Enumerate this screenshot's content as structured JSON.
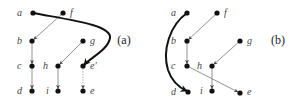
{
  "diagram": {
    "panels": [
      {
        "id": "a",
        "caption": "(a)",
        "caption_pos": [
          124,
          44
        ],
        "nodes": [
          {
            "id": "a",
            "label": "a",
            "x": 33,
            "y": 13,
            "lx": 17,
            "ly": 16
          },
          {
            "id": "f",
            "label": "f",
            "x": 63,
            "y": 13,
            "lx": 70,
            "ly": 16
          },
          {
            "id": "b",
            "label": "b",
            "x": 32,
            "y": 41,
            "lx": 17,
            "ly": 44
          },
          {
            "id": "g",
            "label": "g",
            "x": 83,
            "y": 41,
            "lx": 90,
            "ly": 44
          },
          {
            "id": "c",
            "label": "c",
            "x": 32,
            "y": 66,
            "lx": 17,
            "ly": 69
          },
          {
            "id": "h",
            "label": "h",
            "x": 58,
            "y": 66,
            "lx": 43,
            "ly": 69
          },
          {
            "id": "e'",
            "label": "e'",
            "x": 83,
            "y": 66,
            "lx": 90,
            "ly": 69
          },
          {
            "id": "d",
            "label": "d",
            "x": 32,
            "y": 91,
            "lx": 17,
            "ly": 94
          },
          {
            "id": "i",
            "label": "i",
            "x": 58,
            "y": 91,
            "lx": 46,
            "ly": 94
          },
          {
            "id": "e",
            "label": "e",
            "x": 83,
            "y": 91,
            "lx": 90,
            "ly": 94
          }
        ],
        "edges": [
          {
            "from": "f",
            "to": "b",
            "style": "thin"
          },
          {
            "from": "b",
            "to": "c",
            "style": "thin"
          },
          {
            "from": "c",
            "to": "d",
            "style": "thin"
          },
          {
            "from": "g",
            "to": "h",
            "style": "thin"
          },
          {
            "from": "h",
            "to": "i",
            "style": "thin"
          },
          {
            "from": "e'",
            "to": "e",
            "style": "dotted"
          },
          {
            "from": "a",
            "to": "e'",
            "style": "thick-curve",
            "path": "M33,13 C70,20 112,25 110,38 C108,50 90,58 84,65"
          }
        ]
      },
      {
        "id": "b",
        "caption": "(b)",
        "caption_pos": [
          278,
          44
        ],
        "nodes": [
          {
            "id": "a",
            "label": "a",
            "x": 187,
            "y": 13,
            "lx": 171,
            "ly": 16
          },
          {
            "id": "f",
            "label": "f",
            "x": 217,
            "y": 13,
            "lx": 224,
            "ly": 16
          },
          {
            "id": "b",
            "label": "b",
            "x": 187,
            "y": 41,
            "lx": 171,
            "ly": 44
          },
          {
            "id": "g",
            "label": "g",
            "x": 240,
            "y": 41,
            "lx": 247,
            "ly": 44
          },
          {
            "id": "c",
            "label": "c",
            "x": 187,
            "y": 66,
            "lx": 171,
            "ly": 69
          },
          {
            "id": "h",
            "label": "h",
            "x": 212,
            "y": 66,
            "lx": 197,
            "ly": 69
          },
          {
            "id": "d",
            "label": "d",
            "x": 188,
            "y": 92,
            "lx": 171,
            "ly": 95
          },
          {
            "id": "i",
            "label": "i",
            "x": 212,
            "y": 91,
            "lx": 200,
            "ly": 94
          },
          {
            "id": "e",
            "label": "e",
            "x": 240,
            "y": 93,
            "lx": 247,
            "ly": 95
          }
        ],
        "edges": [
          {
            "from": "f",
            "to": "b",
            "style": "thin"
          },
          {
            "from": "b",
            "to": "c",
            "style": "thin"
          },
          {
            "from": "g",
            "to": "h",
            "style": "thin"
          },
          {
            "from": "h",
            "to": "i",
            "style": "thin"
          },
          {
            "from": "c",
            "to": "e",
            "style": "thin"
          },
          {
            "from": "a",
            "to": "d",
            "style": "thick-curve",
            "path": "M187,13 C170,25 162,50 168,70 C172,82 180,88 187,91"
          }
        ]
      }
    ]
  }
}
